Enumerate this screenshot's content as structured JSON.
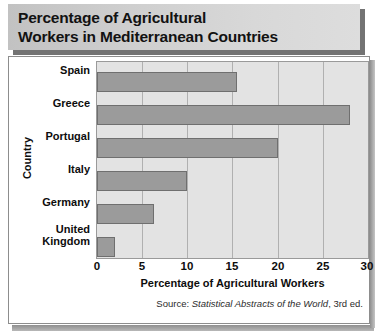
{
  "title": "Percentage of Agricultural\nWorkers in Mediterranean Countries",
  "source": {
    "prefix": "Source: ",
    "work": "Statistical Abstracts of the World",
    "suffix": ", 3rd ed."
  },
  "colors": {
    "bar_fill": "#9b9b9b",
    "bar_border": "#6f6f6f",
    "plot_background": "#e3e3e3",
    "gridline": "#b0b0b0",
    "title_banner": "#d0d0d0",
    "text": "#0d0d0d"
  },
  "chart_data": {
    "type": "bar",
    "orientation": "horizontal",
    "title": "Percentage of Agricultural Workers in Mediterranean Countries",
    "xlabel": "Percentage of Agricultural Workers",
    "ylabel": "Country",
    "categories": [
      "Spain",
      "Greece",
      "Portugal",
      "Italy",
      "Germany",
      "United\nKingdom"
    ],
    "values": [
      15.5,
      28,
      20,
      10,
      6.3,
      2
    ],
    "xlim": [
      0,
      30
    ],
    "xticks": [
      0,
      5,
      10,
      15,
      20,
      25,
      30
    ],
    "xticklabels": [
      "0",
      "5",
      "10",
      "15",
      "20",
      "25",
      "30"
    ],
    "grid": "vertical",
    "legend": "none"
  }
}
